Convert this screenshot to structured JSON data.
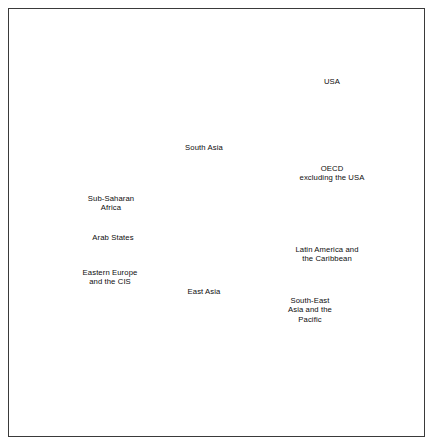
{
  "figure": {
    "background": "#ffffff",
    "frame_color": "#3a3a3a",
    "sector_fill": "#d9d9d9",
    "sector_divider": "#ffffff",
    "wedge_fill": "#000000",
    "label_color": "#0d0d0d"
  },
  "labels": {
    "usa": "USA",
    "oecd": "OECD\nexcluding the USA",
    "latin_america": "Latin America and\nthe Caribbean",
    "south_east_asia": "South-East\nAsia and the\nPacific",
    "east_asia": "East Asia",
    "eastern_europe": "Eastern Europe\nand the CIS",
    "arab_states": "Arab States",
    "sub_saharan": "Sub-Saharan\nAfrica",
    "south_asia": "South Asia"
  },
  "chart_data": {
    "type": "pie",
    "title": "",
    "subtitle": "",
    "xlabel": "",
    "ylabel": "",
    "legend_position": "inline-labels",
    "grid": false,
    "center": {
      "x": 218,
      "y": 232
    },
    "outer_radius": 175,
    "start_angle_deg": -68,
    "direction": "clockwise",
    "categories": [
      "USA",
      "OECD excluding the USA",
      "Latin America and the Caribbean",
      "South-East Asia and the Pacific",
      "East Asia",
      "Eastern Europe and the CIS",
      "Arab States",
      "Sub-Saharan Africa",
      "South Asia"
    ],
    "series": [
      {
        "name": "Sector share (outer pie, % of total)",
        "unit": "%",
        "values": [
          12.0,
          14.5,
          11.5,
          11.0,
          12.0,
          10.5,
          9.0,
          9.0,
          10.5
        ]
      },
      {
        "name": "Inner wedge radius (fraction of outer radius)",
        "unit": "fraction",
        "values": [
          0.78,
          0.48,
          0.06,
          0.05,
          0.1,
          0.04,
          0.07,
          0.03,
          0.05
        ]
      }
    ],
    "sectors": [
      {
        "label": "USA",
        "start_deg": -68,
        "end_deg": -24.8,
        "share": 12.0,
        "wedge_radius_frac": 0.78,
        "label_pos": {
          "x": 332,
          "y": 82
        }
      },
      {
        "label": "OECD excluding the USA",
        "start_deg": -24.8,
        "end_deg": 27.4,
        "share": 14.5,
        "wedge_radius_frac": 0.48,
        "label_pos": {
          "x": 332,
          "y": 173
        }
      },
      {
        "label": "Latin America and the Caribbean",
        "start_deg": 27.4,
        "end_deg": 68.8,
        "share": 11.5,
        "wedge_radius_frac": 0.06,
        "label_pos": {
          "x": 327,
          "y": 254
        }
      },
      {
        "label": "South-East Asia and the Pacific",
        "start_deg": 68.8,
        "end_deg": 108.4,
        "share": 11.0,
        "wedge_radius_frac": 0.05,
        "label_pos": {
          "x": 310,
          "y": 310
        }
      },
      {
        "label": "East Asia",
        "start_deg": 108.4,
        "end_deg": 151.6,
        "share": 12.0,
        "wedge_radius_frac": 0.1,
        "label_pos": {
          "x": 204,
          "y": 292
        }
      },
      {
        "label": "Eastern Europe and the CIS",
        "start_deg": 151.6,
        "end_deg": 189.4,
        "share": 10.5,
        "wedge_radius_frac": 0.04,
        "label_pos": {
          "x": 110,
          "y": 277
        }
      },
      {
        "label": "Arab States",
        "start_deg": 189.4,
        "end_deg": 221.8,
        "share": 9.0,
        "wedge_radius_frac": 0.07,
        "label_pos": {
          "x": 113,
          "y": 238
        }
      },
      {
        "label": "Sub-Saharan Africa",
        "start_deg": 221.8,
        "end_deg": 254.2,
        "share": 9.0,
        "wedge_radius_frac": 0.03,
        "label_pos": {
          "x": 111,
          "y": 203
        }
      },
      {
        "label": "South Asia",
        "start_deg": 254.2,
        "end_deg": 292.0,
        "share": 10.5,
        "wedge_radius_frac": 0.05,
        "label_pos": {
          "x": 204,
          "y": 148
        }
      }
    ]
  }
}
